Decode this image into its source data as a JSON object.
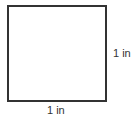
{
  "diagram": {
    "shape": "square",
    "stroke_color": "#333333",
    "side_label": "1 in",
    "bottom_label": "1 in"
  }
}
